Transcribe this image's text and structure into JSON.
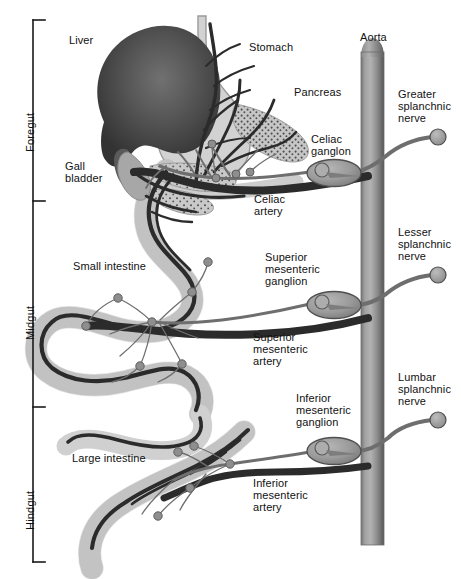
{
  "figure": {
    "width": 461,
    "height": 579,
    "background": "#ffffff"
  },
  "region_brackets": {
    "axis_x": 33,
    "top": 20,
    "bottom": 562,
    "tick_length": 12,
    "color": "#1a1a1a",
    "items": [
      {
        "label": "Foregut",
        "y_start": 20,
        "y_end": 201,
        "label_y": 130
      },
      {
        "label": "Midgut",
        "y_start": 201,
        "y_end": 407,
        "label_y": 322
      },
      {
        "label": "Hindgut",
        "y_start": 407,
        "y_end": 562,
        "label_y": 512
      }
    ]
  },
  "organ_labels": [
    {
      "name": "liver",
      "text": "Liver",
      "x": 69,
      "y": 34,
      "lines": [
        "Liver"
      ]
    },
    {
      "name": "gall-bladder",
      "text": "Gall bladder",
      "x": 65,
      "y": 166,
      "lines": [
        "Gall",
        "bladder"
      ]
    },
    {
      "name": "stomach",
      "text": "Stomach",
      "x": 249,
      "y": 41,
      "lines": [
        "Stomach"
      ]
    },
    {
      "name": "pancreas",
      "text": "Pancreas",
      "x": 294,
      "y": 86,
      "lines": [
        "Pancreas"
      ]
    },
    {
      "name": "small-intestine",
      "text": "Small intestine",
      "x": 73,
      "y": 260,
      "lines": [
        "Small intestine"
      ]
    },
    {
      "name": "large-intestine",
      "text": "Large intestine",
      "x": 72,
      "y": 452,
      "lines": [
        "Large intestine"
      ]
    },
    {
      "name": "aorta",
      "text": "Aorta",
      "x": 360,
      "y": 33,
      "lines": [
        "Aorta"
      ]
    }
  ],
  "ganglion_labels": [
    {
      "name": "celiac-ganglion",
      "x": 311,
      "y": 133,
      "lines": [
        "Celiac",
        "ganglon"
      ]
    },
    {
      "name": "superior-mesenteric-ganglion",
      "x": 265,
      "y": 251,
      "lines": [
        "Superior",
        "mesenteric",
        "ganglion"
      ]
    },
    {
      "name": "inferior-mesenteric-ganglion",
      "x": 296,
      "y": 392,
      "lines": [
        "Inferior",
        "mesenteric",
        "ganglion"
      ]
    }
  ],
  "artery_labels": [
    {
      "name": "celiac-artery",
      "x": 254,
      "y": 196,
      "lines": [
        "Celiac",
        "artery"
      ]
    },
    {
      "name": "superior-mesenteric-artery",
      "x": 253,
      "y": 331,
      "lines": [
        "Superior",
        "mesenteric",
        "artery"
      ]
    },
    {
      "name": "inferior-mesenteric-artery",
      "x": 253,
      "y": 477,
      "lines": [
        "Inferior",
        "mesenteric",
        "artery"
      ]
    }
  ],
  "nerve_labels": [
    {
      "name": "greater-splanchnic-nerve",
      "x": 398,
      "y": 90,
      "lines": [
        "Greater",
        "splanchnic",
        "nerve"
      ]
    },
    {
      "name": "lesser-splanchnic-nerve",
      "x": 398,
      "y": 243,
      "lines": [
        "Lesser",
        "splanchnic",
        "nerve"
      ]
    },
    {
      "name": "lumbar-splanchnic-nerve",
      "x": 398,
      "y": 382,
      "lines": [
        "Lumbar",
        "splanchnic",
        "nerve"
      ]
    }
  ],
  "ganglia_shapes": [
    {
      "name": "celiac-ganglion-body",
      "cx": 334,
      "cy": 173,
      "rx": 26,
      "ry": 13
    },
    {
      "name": "superior-mesenteric-ganglion-body",
      "cx": 334,
      "cy": 305,
      "rx": 26,
      "ry": 13
    },
    {
      "name": "inferior-mesenteric-ganglion-body",
      "cx": 334,
      "cy": 451,
      "rx": 26,
      "ry": 13
    }
  ],
  "nerve_terminals": [
    {
      "name": "greater-splanchnic-terminal",
      "cx": 438,
      "cy": 137,
      "r": 8
    },
    {
      "name": "lesser-splanchnic-terminal",
      "cx": 438,
      "cy": 275,
      "r": 8
    },
    {
      "name": "lumbar-splanchnic-terminal",
      "cx": 438,
      "cy": 420,
      "r": 8
    }
  ],
  "aorta": {
    "name": "aorta-vessel",
    "x": 361,
    "y": 46,
    "width": 23,
    "height": 499,
    "cap_radius": 11
  },
  "colors": {
    "liver_dark": "#3c3c3c",
    "liver_light": "#6d6d6d",
    "gut_fill": "#d0d0d0",
    "gut_stroke": "#8f8f8f",
    "pancreas_fill": "#bdbdbd",
    "artery_dark": "#2b2b2b",
    "nerve_gray": "#6e6e6e",
    "ganglion_fill": "#9a9a9a",
    "ganglion_stroke": "#4a4a4a",
    "aorta_mid": "#9a9a9a",
    "aorta_edge": "#5c5c5c",
    "text": "#111111",
    "bracket": "#1a1a1a"
  }
}
